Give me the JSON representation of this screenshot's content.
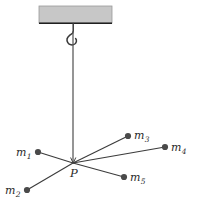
{
  "figure": {
    "background_color": "#ffffff",
    "width": 197,
    "height": 202,
    "ceiling": {
      "name": "ceiling-block",
      "fill_color": "#c7c7c7",
      "edge_color": "#9a9a9a",
      "underline_color": "#1f1f1f",
      "x": 39,
      "y": 6,
      "width": 73,
      "height": 17
    },
    "hook": {
      "name": "ceiling-hook",
      "stroke_color": "#3a3a3a"
    },
    "string": {
      "name": "vertical-string",
      "stroke_color": "#555555",
      "x": 73,
      "y_top": 23,
      "y_bottom": 163
    },
    "junction": {
      "label": "P",
      "x": 73,
      "y": 163,
      "label_x": 70,
      "label_y": 168
    },
    "line_color": "#3c3c3c",
    "dot_color": "#4a4a4a",
    "dot_radius": 3.1,
    "masses": [
      {
        "id": "m1",
        "label": "m",
        "subscript": "1",
        "dot_x": 38,
        "dot_y": 152,
        "label_x": 16,
        "label_y": 147
      },
      {
        "id": "m2",
        "label": "m",
        "subscript": "2",
        "dot_x": 27,
        "dot_y": 190,
        "label_x": 5,
        "label_y": 185
      },
      {
        "id": "m3",
        "label": "m",
        "subscript": "3",
        "dot_x": 128,
        "dot_y": 136,
        "label_x": 134,
        "label_y": 130
      },
      {
        "id": "m4",
        "label": "m",
        "subscript": "4",
        "dot_x": 165,
        "dot_y": 147,
        "label_x": 171,
        "label_y": 142
      },
      {
        "id": "m5",
        "label": "m",
        "subscript": "5",
        "dot_x": 124,
        "dot_y": 177,
        "label_x": 130,
        "label_y": 172
      }
    ]
  }
}
